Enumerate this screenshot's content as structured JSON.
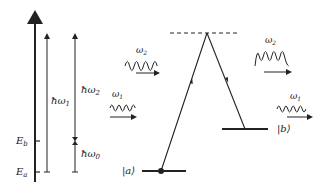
{
  "energy_axis": {
    "levels": [
      {
        "label": "E_b",
        "display": "E",
        "sub": "b"
      },
      {
        "label": "E_a",
        "display": "E",
        "sub": "a"
      }
    ],
    "arrows": [
      {
        "label": "ħω1",
        "display": "ħω",
        "sub": "1"
      },
      {
        "label": "ħω2",
        "display": "ħω",
        "sub": "2"
      },
      {
        "label": "ħω0",
        "display": "ħω",
        "sub": "0"
      }
    ]
  },
  "incoming_waves": [
    {
      "label": "ω2",
      "display": "ω",
      "sub": "2"
    },
    {
      "label": "ω1",
      "display": "ω",
      "sub": "1"
    }
  ],
  "outgoing_waves": [
    {
      "label": "ω2",
      "display": "ω",
      "sub": "2"
    },
    {
      "label": "ω1",
      "display": "ω",
      "sub": "1"
    }
  ],
  "states": [
    {
      "label": "|a⟩",
      "display": "|a⟩"
    },
    {
      "label": "|b⟩",
      "display": "|b⟩"
    }
  ],
  "colors": {
    "ink": "#222222",
    "background": "#ffffff"
  }
}
